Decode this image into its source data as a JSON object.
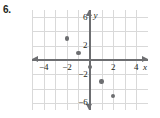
{
  "problem": {
    "number": "6."
  },
  "chart_data": {
    "type": "scatter",
    "title": "",
    "xlabel": "x",
    "ylabel": "y",
    "xlim": [
      -5,
      5
    ],
    "ylim": [
      -7,
      7
    ],
    "grid": true,
    "legend": "none",
    "x_ticks": [
      {
        "value": -4,
        "label": "−4"
      },
      {
        "value": -2,
        "label": "−2"
      },
      {
        "value": 2,
        "label": "2"
      },
      {
        "value": 4,
        "label": "4"
      }
    ],
    "y_ticks": [
      {
        "value": 6,
        "label": "6"
      },
      {
        "value": 2,
        "label": "2"
      },
      {
        "value": -2,
        "label": "−2"
      },
      {
        "value": -6,
        "label": "−6"
      }
    ],
    "points": [
      {
        "x": -2,
        "y": 3
      },
      {
        "x": -1,
        "y": 1
      },
      {
        "x": 0,
        "y": -1
      },
      {
        "x": 1,
        "y": -3
      },
      {
        "x": 2,
        "y": -5
      }
    ],
    "axis_labels": {
      "x": "x",
      "y": "y"
    }
  }
}
